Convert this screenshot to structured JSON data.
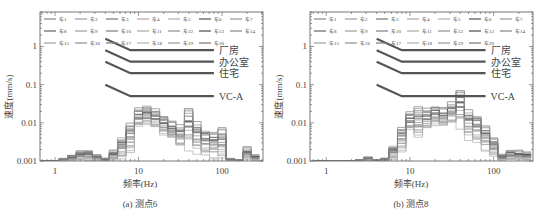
{
  "chart_data": [
    {
      "type": "line",
      "subtype": "step-histogram (1/3 octave bands), log-log",
      "caption": "(a) 测点6",
      "xlabel": "频率(Hz)",
      "ylabel": "速度(mm/s)",
      "xscale": "log",
      "yscale": "log",
      "xlim": [
        0.66,
        310
      ],
      "ylim": [
        0.001,
        8
      ],
      "xticks": [
        {
          "v": 1,
          "label": "1"
        },
        {
          "v": 10,
          "label": "10"
        },
        {
          "v": 100,
          "label": "100"
        }
      ],
      "yticks": [
        {
          "v": 0.001,
          "label": "0.001"
        },
        {
          "v": 0.01,
          "label": "0.01"
        },
        {
          "v": 0.1,
          "label": "0.1"
        },
        {
          "v": 1,
          "label": "1"
        }
      ],
      "grid": false,
      "legend": {
        "position": "top, 7 columns x 3 rows",
        "entries": [
          "车1",
          "车2",
          "车3",
          "车4",
          "车5",
          "车6",
          "车7",
          "车8",
          "车9",
          "车10",
          "车11",
          "车12",
          "车13",
          "车14",
          "车15",
          "车16",
          "车17",
          "车18",
          "车19",
          "车20"
        ]
      },
      "criteria": [
        {
          "label": "厂房",
          "points": [
            [
              4,
              1.6
            ],
            [
              8,
              0.8
            ],
            [
              80,
              0.8
            ]
          ]
        },
        {
          "label": "办公室",
          "points": [
            [
              4,
              0.8
            ],
            [
              8,
              0.4
            ],
            [
              80,
              0.4
            ]
          ]
        },
        {
          "label": "住宅",
          "points": [
            [
              4,
              0.4
            ],
            [
              8,
              0.2
            ],
            [
              80,
              0.2
            ]
          ]
        },
        {
          "label": "VC-A",
          "points": [
            [
              4,
              0.1
            ],
            [
              8,
              0.05
            ],
            [
              80,
              0.05
            ]
          ]
        }
      ],
      "bands": [
        0.8,
        1,
        1.25,
        1.6,
        2,
        2.5,
        3.15,
        4,
        5,
        6.3,
        8,
        10,
        12.5,
        16,
        20,
        25,
        31.5,
        40,
        50,
        63,
        80,
        100,
        125,
        160,
        200,
        250
      ],
      "envelope_max": [
        0.001,
        0.001,
        0.0012,
        0.0015,
        0.002,
        0.002,
        0.0015,
        0.0012,
        0.002,
        0.005,
        0.012,
        0.028,
        0.032,
        0.03,
        0.02,
        0.013,
        0.01,
        0.035,
        0.016,
        0.008,
        0.009,
        0.009,
        0.0012,
        0.0011,
        0.0025,
        0.0015
      ],
      "envelope_min": [
        0.001,
        0.001,
        0.001,
        0.001,
        0.001,
        0.001,
        0.001,
        0.001,
        0.001,
        0.001,
        0.0014,
        0.006,
        0.008,
        0.006,
        0.004,
        0.003,
        0.002,
        0.0016,
        0.0013,
        0.0012,
        0.001,
        0.001,
        0.001,
        0.001,
        0.001,
        0.001
      ],
      "series": [
        {
          "name": "车1",
          "shade": 0.55,
          "level": 0.6
        },
        {
          "name": "车2",
          "shade": 0.7,
          "level": 0.35
        },
        {
          "name": "车3",
          "shade": 0.45,
          "level": 0.8
        },
        {
          "name": "车4",
          "shade": 0.75,
          "level": 0.2
        },
        {
          "name": "车5",
          "shade": 0.8,
          "level": 0.1
        },
        {
          "name": "车6",
          "shade": 0.25,
          "level": 0.7
        },
        {
          "name": "车7",
          "shade": 0.65,
          "level": 0.45
        },
        {
          "name": "车8",
          "shade": 0.35,
          "level": 0.75
        },
        {
          "name": "车9",
          "shade": 0.7,
          "level": 0.3
        },
        {
          "name": "车10",
          "shade": 0.5,
          "level": 0.55
        },
        {
          "name": "车11",
          "shade": 0.75,
          "level": 0.25
        },
        {
          "name": "车12",
          "shade": 0.6,
          "level": 0.5
        },
        {
          "name": "车13",
          "shade": 0.2,
          "level": 0.65
        },
        {
          "name": "车14",
          "shade": 0.55,
          "level": 0.4
        },
        {
          "name": "车15",
          "shade": 0.7,
          "level": 0.15
        },
        {
          "name": "车16",
          "shade": 0.6,
          "level": 0.85
        },
        {
          "name": "车17",
          "shade": 0.5,
          "level": 0.95
        },
        {
          "name": "车18",
          "shade": 0.8,
          "level": 0.05
        },
        {
          "name": "车19",
          "shade": 0.65,
          "level": 0.9
        },
        {
          "name": "车20",
          "shade": 0.45,
          "level": 0.58
        }
      ]
    },
    {
      "type": "line",
      "subtype": "step-histogram (1/3 octave bands), log-log",
      "caption": "(b) 测点8",
      "xlabel": "频率(Hz)",
      "ylabel": "速度(mm/s)",
      "xscale": "log",
      "yscale": "log",
      "xlim": [
        0.64,
        295
      ],
      "ylim": [
        0.001,
        8
      ],
      "xticks": [
        {
          "v": 1,
          "label": "1"
        },
        {
          "v": 10,
          "label": "10"
        },
        {
          "v": 100,
          "label": "100"
        }
      ],
      "yticks": [
        {
          "v": 0.001,
          "label": "0.001"
        },
        {
          "v": 0.01,
          "label": "0.01"
        },
        {
          "v": 0.1,
          "label": "0.1"
        },
        {
          "v": 1,
          "label": "1"
        }
      ],
      "grid": false,
      "legend": {
        "position": "top, 7 columns x 3 rows",
        "entries": [
          "车1",
          "车2",
          "车3",
          "车4",
          "车5",
          "车6",
          "车7",
          "车8",
          "车9",
          "车10",
          "车11",
          "车12",
          "车13",
          "车14",
          "车15",
          "车16",
          "车17",
          "车18",
          "车19",
          "车20"
        ]
      },
      "criteria": [
        {
          "label": "厂房",
          "points": [
            [
              4,
              1.6
            ],
            [
              8,
              0.8
            ],
            [
              80,
              0.8
            ]
          ]
        },
        {
          "label": "办公室",
          "points": [
            [
              4,
              0.8
            ],
            [
              8,
              0.4
            ],
            [
              80,
              0.4
            ]
          ]
        },
        {
          "label": "住宅",
          "points": [
            [
              4,
              0.4
            ],
            [
              8,
              0.2
            ],
            [
              80,
              0.2
            ]
          ]
        },
        {
          "label": "VC-A",
          "points": [
            [
              4,
              0.1
            ],
            [
              8,
              0.05
            ],
            [
              80,
              0.05
            ]
          ]
        }
      ],
      "bands": [
        0.8,
        1,
        1.25,
        1.6,
        2,
        2.5,
        3.15,
        4,
        5,
        6.3,
        8,
        10,
        12.5,
        16,
        20,
        25,
        31.5,
        40,
        50,
        63,
        80,
        100,
        125,
        160,
        200,
        250
      ],
      "envelope_max": [
        0.001,
        0.001,
        0.001,
        0.001,
        0.001,
        0.0011,
        0.0013,
        0.0011,
        0.0012,
        0.0028,
        0.009,
        0.022,
        0.035,
        0.032,
        0.036,
        0.03,
        0.04,
        0.1,
        0.032,
        0.02,
        0.013,
        0.0045,
        0.0016,
        0.002,
        0.002,
        0.0018
      ],
      "envelope_min": [
        0.001,
        0.001,
        0.001,
        0.001,
        0.001,
        0.001,
        0.001,
        0.001,
        0.001,
        0.001,
        0.0015,
        0.005,
        0.0035,
        0.0055,
        0.007,
        0.006,
        0.008,
        0.006,
        0.003,
        0.0025,
        0.0016,
        0.0012,
        0.001,
        0.001,
        0.001,
        0.001
      ],
      "series": [
        {
          "name": "车1",
          "shade": 0.55,
          "level": 0.6
        },
        {
          "name": "车2",
          "shade": 0.7,
          "level": 0.35
        },
        {
          "name": "车3",
          "shade": 0.45,
          "level": 0.8
        },
        {
          "name": "车4",
          "shade": 0.75,
          "level": 0.2
        },
        {
          "name": "车5",
          "shade": 0.8,
          "level": 0.1
        },
        {
          "name": "车6",
          "shade": 0.25,
          "level": 0.7
        },
        {
          "name": "车7",
          "shade": 0.65,
          "level": 0.45
        },
        {
          "name": "车8",
          "shade": 0.35,
          "level": 0.75
        },
        {
          "name": "车9",
          "shade": 0.7,
          "level": 0.3
        },
        {
          "name": "车10",
          "shade": 0.5,
          "level": 0.55
        },
        {
          "name": "车11",
          "shade": 0.75,
          "level": 0.25
        },
        {
          "name": "车12",
          "shade": 0.6,
          "level": 0.5
        },
        {
          "name": "车13",
          "shade": 0.2,
          "level": 0.65
        },
        {
          "name": "车14",
          "shade": 0.55,
          "level": 0.4
        },
        {
          "name": "车15",
          "shade": 0.7,
          "level": 0.15
        },
        {
          "name": "车16",
          "shade": 0.6,
          "level": 0.85
        },
        {
          "name": "车17",
          "shade": 0.5,
          "level": 0.95
        },
        {
          "name": "车18",
          "shade": 0.8,
          "level": 0.05
        },
        {
          "name": "车19",
          "shade": 0.65,
          "level": 0.9
        },
        {
          "name": "车20",
          "shade": 0.45,
          "level": 0.58
        }
      ]
    }
  ],
  "colors": {
    "frame": "#555555",
    "criteria_line": "#555555",
    "text": "#444444"
  }
}
